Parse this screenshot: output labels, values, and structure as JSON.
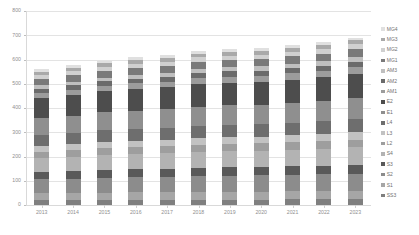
{
  "chart_data": {
    "type": "bar",
    "stacked": true,
    "title": "",
    "xlabel": "",
    "ylabel": "",
    "ylim": [
      0,
      800
    ],
    "yticks": [
      0,
      100,
      200,
      300,
      400,
      500,
      600,
      700,
      800
    ],
    "grid": true,
    "legend_position": "right",
    "categories": [
      "2013",
      "2014",
      "2015",
      "2016",
      "2017",
      "2018",
      "2019",
      "2020",
      "2021",
      "2022",
      "2023"
    ],
    "totals": [
      562,
      578,
      596,
      610,
      618,
      635,
      645,
      650,
      660,
      672,
      690
    ],
    "series": [
      {
        "name": "SS3",
        "color": "#7f7f7f",
        "values": [
          20,
          20,
          21,
          21,
          21,
          22,
          22,
          22,
          23,
          23,
          23
        ]
      },
      {
        "name": "S1",
        "color": "#a6a6a6",
        "values": [
          28,
          29,
          30,
          31,
          31,
          32,
          32,
          33,
          33,
          34,
          35
        ]
      },
      {
        "name": "S2",
        "color": "#8c8c8c",
        "values": [
          58,
          60,
          62,
          63,
          64,
          65,
          66,
          67,
          68,
          69,
          71
        ]
      },
      {
        "name": "S3",
        "color": "#595959",
        "values": [
          30,
          31,
          32,
          33,
          33,
          34,
          35,
          35,
          36,
          36,
          37
        ]
      },
      {
        "name": "S4",
        "color": "#b3b3b3",
        "values": [
          58,
          60,
          62,
          63,
          64,
          66,
          67,
          67,
          68,
          70,
          72
        ]
      },
      {
        "name": "L2",
        "color": "#9e9e9e",
        "values": [
          26,
          27,
          28,
          28,
          29,
          30,
          30,
          30,
          31,
          31,
          32
        ]
      },
      {
        "name": "L3",
        "color": "#c2c2c2",
        "values": [
          24,
          25,
          26,
          26,
          27,
          27,
          28,
          28,
          28,
          29,
          30
        ]
      },
      {
        "name": "L4",
        "color": "#6e6e6e",
        "values": [
          44,
          45,
          47,
          48,
          49,
          50,
          51,
          51,
          52,
          53,
          55
        ]
      },
      {
        "name": "E1",
        "color": "#8f8f8f",
        "values": [
          70,
          72,
          74,
          76,
          77,
          79,
          80,
          81,
          82,
          84,
          86
        ]
      },
      {
        "name": "E2",
        "color": "#4d4d4d",
        "values": [
          82,
          84,
          87,
          89,
          90,
          93,
          94,
          95,
          96,
          98,
          100
        ]
      },
      {
        "name": "AM1",
        "color": "#9c9c9c",
        "values": [
          22,
          22,
          23,
          24,
          24,
          25,
          25,
          25,
          26,
          26,
          27
        ]
      },
      {
        "name": "AM2",
        "color": "#6b6b6b",
        "values": [
          18,
          19,
          19,
          20,
          20,
          21,
          21,
          21,
          22,
          22,
          23
        ]
      },
      {
        "name": "AM3",
        "color": "#bfbfbf",
        "values": [
          14,
          15,
          15,
          16,
          16,
          16,
          17,
          17,
          17,
          18,
          18
        ]
      },
      {
        "name": "MG1",
        "color": "#7a7a7a",
        "values": [
          26,
          27,
          28,
          28,
          29,
          30,
          30,
          30,
          31,
          32,
          33
        ]
      },
      {
        "name": "MG2",
        "color": "#d0d0d0",
        "values": [
          16,
          17,
          17,
          18,
          18,
          19,
          19,
          19,
          20,
          20,
          21
        ]
      },
      {
        "name": "MG3",
        "color": "#a9a9a9",
        "values": [
          14,
          14,
          15,
          15,
          15,
          16,
          16,
          16,
          17,
          17,
          17
        ]
      },
      {
        "name": "MG4",
        "color": "#e0e0e0",
        "values": [
          12,
          11,
          10,
          11,
          11,
          10,
          12,
          13,
          10,
          10,
          10
        ]
      }
    ],
    "legend_order": [
      "MG4",
      "MG3",
      "MG2",
      "MG1",
      "AM3",
      "AM2",
      "AM1",
      "E2",
      "E1",
      "L4",
      "L3",
      "L2",
      "S4",
      "S3",
      "S2",
      "S1",
      "SS3"
    ]
  },
  "axes": {
    "y_tick_labels": [
      "800",
      "700",
      "600",
      "500",
      "400",
      "300",
      "200",
      "100",
      "0"
    ],
    "x_tick_labels": [
      "2013",
      "2014",
      "2015",
      "2016",
      "2017",
      "2018",
      "2019",
      "2020",
      "2021",
      "2022",
      "2023"
    ]
  },
  "colors": {
    "gridline": "#e3e3e3",
    "axis": "#d9d9d9",
    "tick_text": "#8f8f8f",
    "legend_text": "#6f6f6f",
    "background": "#ffffff"
  }
}
